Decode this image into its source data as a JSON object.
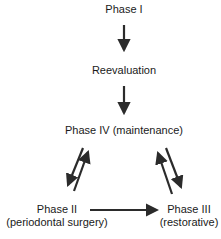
{
  "diagram": {
    "type": "flowchart",
    "nodes": {
      "phase1": {
        "label": "Phase I"
      },
      "reevaluation": {
        "label": "Reevaluation"
      },
      "phase4": {
        "label": "Phase IV (maintenance)"
      },
      "phase2": {
        "line1": "Phase II",
        "line2": "(periodontal surgery)"
      },
      "phase3": {
        "line1": "Phase III",
        "line2": "(restorative)"
      }
    },
    "edges": [
      {
        "from": "Phase I",
        "to": "Reevaluation"
      },
      {
        "from": "Reevaluation",
        "to": "Phase IV (maintenance)"
      },
      {
        "from": "Phase IV (maintenance)",
        "to": "Phase II"
      },
      {
        "from": "Phase II",
        "to": "Phase IV (maintenance)"
      },
      {
        "from": "Phase IV (maintenance)",
        "to": "Phase III"
      },
      {
        "from": "Phase III",
        "to": "Phase IV (maintenance)"
      },
      {
        "from": "Phase II",
        "to": "Phase III"
      }
    ],
    "colors": {
      "arrow": "#2b2b2b",
      "text": "#1a1a1a",
      "background": "#ffffff"
    }
  }
}
